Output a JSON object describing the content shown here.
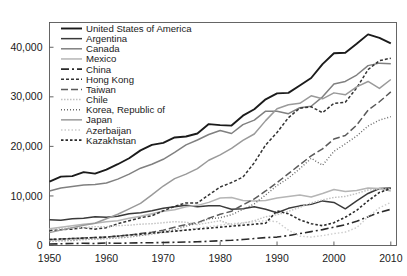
{
  "chart_data": {
    "type": "line",
    "title": "",
    "subtitle": "",
    "xlabel": "",
    "ylabel": "",
    "xlim": [
      1950,
      2011
    ],
    "ylim": [
      0,
      45000
    ],
    "xticks": [
      "1950",
      "1960",
      "1970",
      "1980",
      "1990",
      "2000",
      "2010"
    ],
    "xtick_values": [
      1950,
      1960,
      1970,
      1980,
      1990,
      2000,
      2010
    ],
    "yticks": [
      "0",
      "10,000",
      "20,000",
      "30,000",
      "40,000"
    ],
    "ytick_values": [
      0,
      10000,
      20000,
      30000,
      40000
    ],
    "grid": false,
    "legend_position": "top-left-inside",
    "frame": true,
    "x": [
      1950,
      1952,
      1954,
      1956,
      1958,
      1960,
      1962,
      1964,
      1966,
      1968,
      1970,
      1972,
      1974,
      1976,
      1978,
      1980,
      1982,
      1984,
      1986,
      1988,
      1990,
      1992,
      1994,
      1996,
      1998,
      2000,
      2002,
      2004,
      2006,
      2008,
      2010
    ],
    "series": [
      {
        "name": "United States of America",
        "color": "#1b1b1b",
        "width": 1.9,
        "dash": "none",
        "values": [
          12900,
          13900,
          14000,
          14800,
          14500,
          15300,
          16400,
          17600,
          19200,
          20300,
          20700,
          21800,
          22000,
          22600,
          24500,
          24300,
          24200,
          26200,
          27500,
          29500,
          30700,
          30800,
          32300,
          33800,
          36600,
          38800,
          38900,
          40700,
          42600,
          41900,
          40800
        ]
      },
      {
        "name": "Argentina",
        "color": "#3a3a3a",
        "width": 1.5,
        "dash": "none",
        "values": [
          5200,
          5100,
          5400,
          5500,
          5800,
          5700,
          5900,
          6400,
          6600,
          7000,
          7500,
          7800,
          8100,
          7800,
          8000,
          8000,
          7300,
          7400,
          7800,
          7300,
          6600,
          7500,
          8000,
          8300,
          9000,
          8700,
          7400,
          9000,
          10500,
          11500,
          11600
        ]
      },
      {
        "name": "Canada",
        "color": "#808080",
        "width": 1.5,
        "dash": "none",
        "values": [
          11000,
          11600,
          11900,
          12200,
          12300,
          12600,
          13400,
          14400,
          15600,
          16400,
          17400,
          18800,
          20300,
          21300,
          22400,
          23200,
          22600,
          24400,
          25300,
          27100,
          27100,
          26600,
          27800,
          28100,
          30000,
          32600,
          33100,
          34400,
          36300,
          36800,
          36700
        ]
      },
      {
        "name": "Mexico",
        "color": "#b5b5b5",
        "width": 1.5,
        "dash": "none",
        "values": [
          3400,
          3700,
          4000,
          4300,
          4500,
          4800,
          5000,
          5500,
          5900,
          6400,
          6900,
          7200,
          7800,
          8100,
          8700,
          9600,
          9700,
          9100,
          9000,
          9100,
          9600,
          9900,
          10200,
          9800,
          10500,
          11300,
          10900,
          11100,
          11600,
          11500,
          11000
        ]
      },
      {
        "name": "China",
        "color": "#2a2a2a",
        "width": 1.6,
        "dash": "8,3,2,3",
        "values": [
          300,
          350,
          400,
          450,
          400,
          500,
          450,
          500,
          550,
          550,
          600,
          650,
          700,
          750,
          850,
          950,
          1050,
          1200,
          1400,
          1600,
          1700,
          2000,
          2400,
          2800,
          3200,
          3700,
          4200,
          4900,
          5800,
          6700,
          7300
        ]
      },
      {
        "name": "Hong Kong",
        "color": "#333333",
        "width": 1.5,
        "dash": "3,2",
        "values": [
          3000,
          3200,
          3300,
          3600,
          3300,
          3600,
          4400,
          5000,
          5600,
          6000,
          7000,
          7900,
          8600,
          8600,
          10200,
          11800,
          12700,
          13800,
          16700,
          20300,
          22800,
          25800,
          27700,
          28000,
          26800,
          28700,
          28900,
          31800,
          35500,
          37300,
          37800
        ]
      },
      {
        "name": "Taiwan",
        "color": "#5a5a5a",
        "width": 1.5,
        "dash": "7,3",
        "values": [
          1200,
          1300,
          1400,
          1500,
          1600,
          1700,
          1900,
          2100,
          2400,
          2700,
          3100,
          3700,
          4200,
          4600,
          5500,
          6300,
          6900,
          8200,
          9400,
          11000,
          12700,
          14500,
          16300,
          18100,
          19500,
          21500,
          22200,
          24300,
          27300,
          29000,
          31000
        ]
      },
      {
        "name": "Chile",
        "color": "#c0c0c0",
        "width": 1.4,
        "dash": "1.5,1.5",
        "values": [
          3300,
          3400,
          3600,
          3600,
          3800,
          3800,
          4000,
          4100,
          4300,
          4400,
          4600,
          4800,
          4700,
          4200,
          4600,
          5000,
          4200,
          4500,
          5000,
          5800,
          6200,
          6900,
          7700,
          8600,
          9200,
          9700,
          9900,
          10500,
          11200,
          11400,
          11400
        ]
      },
      {
        "name": "Korea, Republic of",
        "color": "#6a6a6a",
        "width": 1.4,
        "dash": "1,2",
        "values": [
          850,
          950,
          1000,
          1200,
          1300,
          1400,
          1500,
          1700,
          2000,
          2300,
          2800,
          3200,
          3900,
          4500,
          5400,
          5600,
          6200,
          7300,
          8400,
          10200,
          12100,
          13600,
          15500,
          17600,
          16200,
          19000,
          20500,
          22100,
          24100,
          25300,
          26000
        ]
      },
      {
        "name": "Japan",
        "color": "#9a9a9a",
        "width": 1.5,
        "dash": "none",
        "values": [
          2600,
          3100,
          3600,
          4100,
          4500,
          5400,
          6300,
          7400,
          8500,
          10200,
          12000,
          13500,
          14400,
          15500,
          17200,
          18300,
          19600,
          21200,
          22500,
          25200,
          27600,
          28400,
          28700,
          30200,
          29600,
          30800,
          30400,
          32000,
          33100,
          31700,
          33500
        ]
      },
      {
        "name": "Azerbaijan",
        "color": "#cccccc",
        "width": 1.4,
        "dash": "1.5,2",
        "values": [
          1000,
          1100,
          1200,
          1300,
          1400,
          1500,
          1700,
          1900,
          2100,
          2300,
          2600,
          2900,
          3200,
          3500,
          3800,
          4100,
          4400,
          4600,
          4800,
          5000,
          4800,
          3100,
          1900,
          1700,
          2000,
          2400,
          2700,
          3600,
          5800,
          7600,
          8700
        ]
      },
      {
        "name": "Kazakhstan",
        "color": "#2b2b2b",
        "width": 1.6,
        "dash": "2.5,2",
        "values": [
          1200,
          1300,
          1400,
          1500,
          1600,
          1700,
          1900,
          2100,
          2300,
          2500,
          2700,
          2900,
          3100,
          3300,
          3500,
          3700,
          3900,
          4100,
          4300,
          4500,
          7000,
          6400,
          5200,
          4400,
          4000,
          4600,
          5700,
          7100,
          9000,
          10700,
          11500
        ]
      }
    ]
  }
}
